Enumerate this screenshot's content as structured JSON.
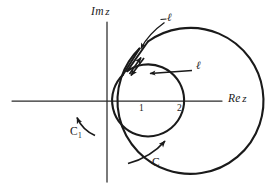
{
  "figure": {
    "background_color": "#ffffff",
    "ink_color": "#1a1a1a",
    "width": 277,
    "height": 190
  },
  "axes": {
    "origin": {
      "x": 107,
      "y": 101
    },
    "imaginary": {
      "label": "Im",
      "variable": "z",
      "orientation": "vertical",
      "x": 107,
      "y_top": 22,
      "y_bottom": 182
    },
    "real": {
      "label": "Re",
      "variable": "z",
      "orientation": "horizontal",
      "y": 101,
      "x_left": 12,
      "x_right": 222
    }
  },
  "circles": [
    {
      "name": "inner-circle",
      "contour_label": "C",
      "contour_subscript": "1",
      "radius_label": "1",
      "radius_px": 36,
      "direction": "counterclockwise",
      "center": {
        "x": 107,
        "y": 101
      }
    },
    {
      "name": "outer-circle",
      "contour_label": "C",
      "contour_subscript": "",
      "radius_label": "2",
      "radius_px": 73,
      "direction": "counterclockwise",
      "center": {
        "x": 107,
        "y": 101
      }
    }
  ],
  "tick_labels": [
    {
      "text": "1",
      "x": 139,
      "y": 105
    },
    {
      "text": "2",
      "x": 177,
      "y": 105
    }
  ],
  "contour_labels": [
    {
      "name": "inner-contour-label",
      "text": "C",
      "sub": "1",
      "x": 70,
      "y": 130
    },
    {
      "name": "outer-contour-label",
      "text": "C",
      "sub": "",
      "x": 152,
      "y": 160
    }
  ],
  "cut": {
    "name": "cut-ell",
    "label": "ℓ",
    "description": "two parallel segments joining the inner circle to the outer circle, traversed in opposite directions",
    "outbound_direction": "outward",
    "inbound_direction": "inward",
    "callouts": [
      {
        "name": "cut-label-top",
        "text": "ℓ",
        "x": 168,
        "y": 18
      },
      {
        "name": "cut-label-right",
        "text": "ℓ",
        "x": 196,
        "y": 66
      }
    ]
  },
  "arrows": [
    {
      "name": "cut-outbound-arrow",
      "points": "outward along the cut toward the outer circle"
    },
    {
      "name": "cut-inbound-arrow",
      "points": "inward along the cut toward the inner circle"
    },
    {
      "name": "inner-circle-arrow",
      "points": "counterclockwise on C1"
    },
    {
      "name": "outer-circle-arrow",
      "points": "counterclockwise on C"
    },
    {
      "name": "leader-arrow-top",
      "points": "from the top label to the cut"
    },
    {
      "name": "leader-arrow-right",
      "points": "from the right label to the cut"
    }
  ]
}
